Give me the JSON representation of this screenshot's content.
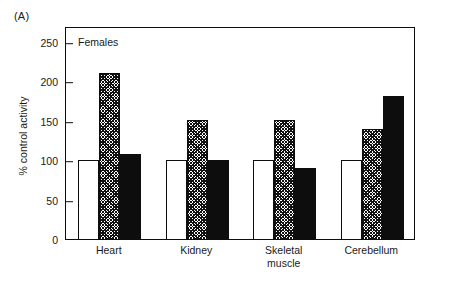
{
  "figure": {
    "panel_letter": "(A)",
    "in_plot_label": "Females"
  },
  "axes": {
    "y_title": "% control activity",
    "y_ticks": [
      "0",
      "50",
      "100",
      "150",
      "200",
      "250"
    ]
  },
  "categories": [
    {
      "label": "Heart"
    },
    {
      "label": "Kidney"
    },
    {
      "label": "Skeletal\nmuscle"
    },
    {
      "label": "Cerebellum"
    }
  ],
  "chart_data": {
    "type": "bar",
    "title": "Females",
    "xlabel": "",
    "ylabel": "% control activity",
    "categories": [
      "Heart",
      "Kidney",
      "Skeletal muscle",
      "Cerebellum"
    ],
    "series": [
      {
        "name": "open",
        "fill": "white",
        "values": [
          100,
          100,
          100,
          100
        ]
      },
      {
        "name": "hatched",
        "fill": "hatched",
        "values": [
          211,
          151,
          151,
          140
        ]
      },
      {
        "name": "solid",
        "fill": "black",
        "values": [
          108,
          100,
          90,
          181
        ]
      }
    ],
    "ylim": [
      0,
      270
    ],
    "yticks": [
      0,
      50,
      100,
      150,
      200,
      250
    ],
    "grid": false,
    "legend": "none",
    "annotations": [
      "(A)",
      "Females"
    ]
  },
  "style": {
    "ink": "#0d0d0d",
    "paper": "#ffffff"
  }
}
